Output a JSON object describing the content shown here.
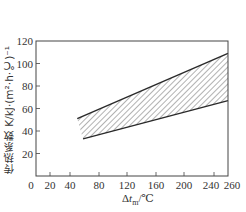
{
  "chart_data": {
    "type": "area",
    "title": "",
    "xlabel": "Δt_m/℃",
    "ylabel": "传热系数 K/kJ·(m²·h·℃)⁻¹",
    "xlim": [
      0,
      260
    ],
    "ylim": [
      0,
      120
    ],
    "x_ticks": [
      0,
      20,
      40,
      80,
      120,
      160,
      200,
      240,
      260
    ],
    "y_ticks": [
      20,
      40,
      60,
      80,
      100,
      120
    ],
    "grid": false,
    "legend": null,
    "series": [
      {
        "name": "upper bound",
        "x": [
          50,
          260
        ],
        "values": [
          51,
          109
        ]
      },
      {
        "name": "lower bound",
        "x": [
          58,
          260
        ],
        "values": [
          33,
          67
        ]
      }
    ],
    "band": {
      "description": "hatched region between lower and upper bound lines",
      "fill": "diagonal-hatch"
    }
  },
  "labels": {
    "xlabel_prefix": "Δ",
    "xlabel_var": "t",
    "xlabel_sub": "m",
    "xlabel_unit": "/℃",
    "ylabel": "传热系数 K/kJ·(m²·h·℃)⁻¹"
  },
  "colors": {
    "line": "#2a2a2a",
    "hatch": "#555555",
    "axis": "#444444"
  }
}
